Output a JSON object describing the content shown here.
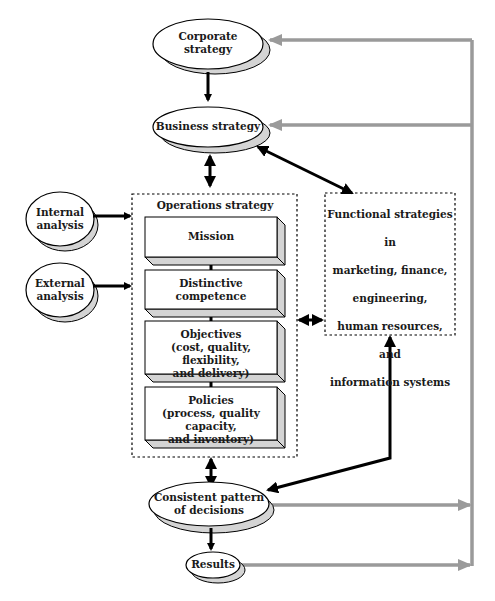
{
  "nodes": {
    "corporate_strategy": {
      "line1": "Corporate",
      "line2": "strategy"
    },
    "business_strategy": {
      "label": "Business strategy"
    },
    "internal_analysis": {
      "line1": "Internal",
      "line2": "analysis"
    },
    "external_analysis": {
      "line1": "External",
      "line2": "analysis"
    },
    "operations_strategy": {
      "title": "Operations strategy",
      "blocks": [
        {
          "lines": [
            "Mission"
          ]
        },
        {
          "lines": [
            "Distinctive",
            "competence"
          ]
        },
        {
          "lines": [
            "Objectives",
            "(cost, quality, flexibility,",
            "and delivery)"
          ]
        },
        {
          "lines": [
            "Policies",
            "(process, quality capacity,",
            "and inventory)"
          ]
        }
      ]
    },
    "functional_strategies": {
      "lines": [
        "Functional strategies in",
        "marketing, finance,",
        "engineering,",
        "human resources, and",
        "information systems"
      ]
    },
    "consistent_pattern": {
      "line1": "Consistent pattern",
      "line2": "of decisions"
    },
    "results": {
      "label": "Results"
    }
  },
  "colors": {
    "black_arrow": "#000000",
    "feedback_arrow": "#9a9a9a",
    "shadow": "#d4d4d4"
  }
}
